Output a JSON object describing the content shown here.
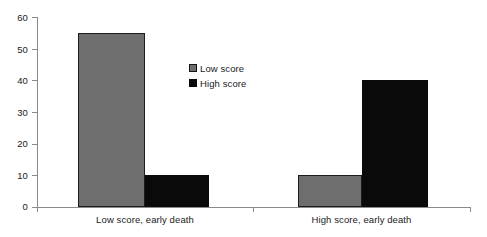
{
  "chart_data": {
    "type": "bar",
    "title": "",
    "subtitle": "",
    "xlabel": "",
    "ylabel": "",
    "categories": [
      "Low score, early death",
      "High score, early death"
    ],
    "series": [
      {
        "name": "Low score",
        "values": [
          55,
          10
        ],
        "color": "#6e6e6e"
      },
      {
        "name": "High score",
        "values": [
          10,
          40
        ],
        "color": "#0a0a0a"
      }
    ],
    "ylim": [
      0,
      60
    ],
    "yticks": [
      0,
      10,
      20,
      30,
      40,
      50,
      60
    ],
    "ytick_labels": [
      "0",
      "10",
      "20",
      "30",
      "40",
      "50",
      "60"
    ],
    "grid": false,
    "legend_position": "inside-upper-center",
    "legend_entries": [
      "Low score",
      "High score"
    ],
    "annotations": []
  },
  "axis": {
    "y_labels": [
      "60",
      "50",
      "40",
      "30",
      "20",
      "10",
      "0"
    ]
  },
  "legend": {
    "items": [
      {
        "label": "Low score"
      },
      {
        "label": "High score"
      }
    ]
  },
  "categories": [
    {
      "label": "Low score, early death"
    },
    {
      "label": "High score, early death"
    }
  ]
}
